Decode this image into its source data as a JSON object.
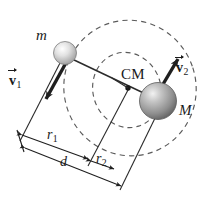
{
  "figure": {
    "background_color": "#ffffff",
    "line_color": "#2b2b2b",
    "dash_color": "#555555",
    "width": 215,
    "height": 206
  },
  "labels": {
    "small_mass": "m",
    "large_mass": "M",
    "center_of_mass": "CM",
    "velocity_1": "v",
    "velocity_1_sub": "1",
    "velocity_2": "v",
    "velocity_2_sub": "2",
    "radius_1": "r",
    "radius_1_sub": "1",
    "radius_2": "r",
    "radius_2_sub": "2",
    "separation": "d"
  },
  "bodies": [
    {
      "name": "m",
      "cx": 65,
      "cy": 53,
      "r": 11.5,
      "fill": "#d9d9d9"
    },
    {
      "name": "M",
      "cx": 158,
      "cy": 101,
      "r": 18.5,
      "fill": "#9a9a9a"
    }
  ],
  "center_of_mass_point": {
    "cx": 128,
    "cy": 88,
    "r": 2.6
  },
  "orbits": [
    {
      "name": "outer-orbit",
      "cx": 130,
      "cy": 88,
      "rx": 66,
      "ry": 68,
      "rotation": -18,
      "dash": "5,4"
    },
    {
      "name": "inner-orbit",
      "cx": 127,
      "cy": 90,
      "rx": 34,
      "ry": 38,
      "rotation": -18,
      "dash": "5,4"
    }
  ],
  "vectors": [
    {
      "name": "v1",
      "x1": 66,
      "y1": 60,
      "x2": 45,
      "y2": 101
    },
    {
      "name": "v2",
      "x1": 157,
      "y1": 96,
      "x2": 179,
      "y2": 58
    }
  ],
  "dimensions": [
    {
      "name": "r1",
      "x1": 22,
      "y1": 135,
      "x2": 88,
      "y2": 159
    },
    {
      "name": "r2",
      "x1": 91,
      "y1": 160,
      "x2": 114,
      "y2": 168
    },
    {
      "name": "d",
      "x1": 24,
      "y1": 148,
      "x2": 121,
      "y2": 186
    }
  ]
}
